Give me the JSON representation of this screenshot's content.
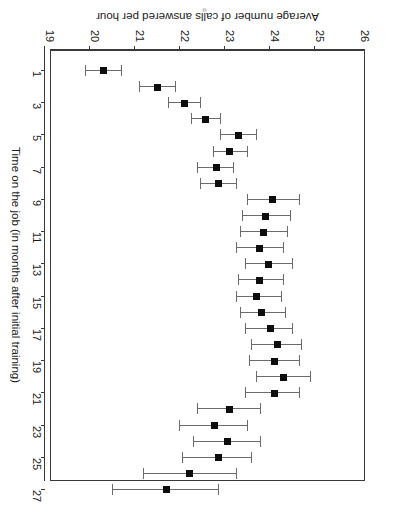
{
  "chart_data": {
    "type": "scatter",
    "title": "",
    "subtitle": "",
    "xlabel": "Time on the job (in months after initial training)",
    "ylabel": "Average number of calls answered per hour",
    "orientation": "rotated-180",
    "grid": false,
    "legend": "none",
    "xlim": [
      0,
      28
    ],
    "ylim": [
      19,
      26
    ],
    "x_tick_labels": [
      "1",
      "3",
      "5",
      "7",
      "9",
      "11",
      "13",
      "15",
      "17",
      "19",
      "21",
      "23",
      "25",
      "27"
    ],
    "x_ticks": [
      1,
      3,
      5,
      7,
      9,
      11,
      13,
      15,
      17,
      19,
      21,
      23,
      25,
      27
    ],
    "y_tick_labels": [
      "26",
      "25",
      "24",
      "23",
      "22",
      "21",
      "20",
      "19"
    ],
    "y_ticks": [
      26,
      25,
      24,
      23,
      22,
      21,
      20,
      19
    ],
    "x": [
      1,
      2,
      3,
      4,
      5,
      6,
      7,
      8,
      9,
      10,
      11,
      12,
      13,
      14,
      15,
      16,
      17,
      18,
      19,
      20,
      21,
      22,
      23,
      24,
      25,
      26,
      27
    ],
    "values": [
      20.2,
      21.4,
      22.0,
      22.45,
      23.2,
      23.0,
      22.7,
      22.75,
      23.95,
      23.8,
      23.75,
      23.65,
      23.85,
      23.65,
      23.6,
      23.7,
      23.9,
      24.05,
      24.0,
      24.2,
      24.0,
      23.0,
      22.65,
      22.95,
      22.75,
      22.1,
      21.6
    ],
    "ci_low": [
      19.8,
      21.0,
      21.65,
      22.15,
      22.8,
      22.65,
      22.3,
      22.35,
      23.4,
      23.3,
      23.25,
      23.15,
      23.35,
      23.2,
      23.15,
      23.25,
      23.35,
      23.5,
      23.45,
      23.6,
      23.35,
      22.3,
      21.9,
      22.2,
      21.95,
      21.1,
      20.4
    ],
    "ci_high": [
      20.6,
      21.8,
      22.35,
      22.8,
      23.6,
      23.4,
      23.1,
      23.15,
      24.55,
      24.35,
      24.3,
      24.2,
      24.4,
      24.2,
      24.15,
      24.25,
      24.4,
      24.6,
      24.55,
      24.8,
      24.55,
      23.7,
      23.4,
      23.7,
      23.5,
      23.15,
      22.75
    ],
    "marker": "filled-square",
    "error_bar_style": "capped-horizontal",
    "marker_color": "#0d0d0d",
    "error_bar_color": "#6b6b6b",
    "axis_color": "#3a3a3a",
    "background_color": "#ffffff"
  },
  "axes": {
    "value_axis_title": "Average number of calls answered per hour",
    "category_axis_title": "Time on the job (in months after initial training)"
  }
}
